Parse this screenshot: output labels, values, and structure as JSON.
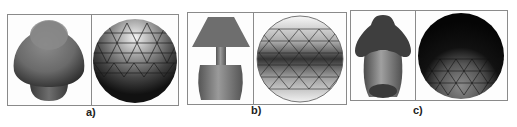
{
  "figure": {
    "panels": [
      {
        "id": "a",
        "label": "a)",
        "left_object": "rounded-cone-mushroom-shape",
        "right_object": "triangulated-sphere-light-top"
      },
      {
        "id": "b",
        "label": "b)",
        "left_object": "table-lamp-shape",
        "right_object": "triangulated-sphere-dark-band"
      },
      {
        "id": "c",
        "label": "c)",
        "left_object": "mushroom-cap-shape",
        "right_object": "triangulated-sphere-dark-top"
      }
    ]
  },
  "colors": {
    "frame": "#8a8a8a",
    "shape_mid": "#7a7a7a",
    "shape_dark": "#2a2a2a",
    "mesh_line": "#1a1a1a",
    "background": "#ffffff"
  }
}
